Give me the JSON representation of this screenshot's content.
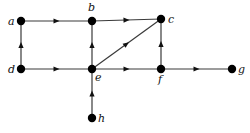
{
  "diagram": {
    "type": "directed-graph",
    "colors": {
      "edge": "#3a3a3a",
      "node": "#000000",
      "label": "#111111",
      "background": "#ffffff"
    },
    "nodes": [
      {
        "id": "a",
        "label": "a",
        "x": 21,
        "y": 21,
        "lx": 8,
        "ly": 25
      },
      {
        "id": "b",
        "label": "b",
        "x": 92,
        "y": 21,
        "lx": 88,
        "ly": 11
      },
      {
        "id": "c",
        "label": "c",
        "x": 161,
        "y": 19,
        "lx": 168,
        "ly": 23
      },
      {
        "id": "d",
        "label": "d",
        "x": 21,
        "y": 69,
        "lx": 8,
        "ly": 73
      },
      {
        "id": "e",
        "label": "e",
        "x": 92,
        "y": 69,
        "lx": 95,
        "ly": 81
      },
      {
        "id": "f",
        "label": "f",
        "x": 161,
        "y": 69,
        "lx": 158,
        "ly": 83
      },
      {
        "id": "g",
        "label": "g",
        "x": 232,
        "y": 69,
        "lx": 238,
        "ly": 73
      },
      {
        "id": "h",
        "label": "h",
        "x": 92,
        "y": 118,
        "lx": 98,
        "ly": 122
      }
    ],
    "edges": [
      {
        "from": "a",
        "to": "b"
      },
      {
        "from": "d",
        "to": "a"
      },
      {
        "from": "d",
        "to": "e"
      },
      {
        "from": "e",
        "to": "b"
      },
      {
        "from": "b",
        "to": "c"
      },
      {
        "from": "e",
        "to": "c"
      },
      {
        "from": "f",
        "to": "c"
      },
      {
        "from": "e",
        "to": "f"
      },
      {
        "from": "f",
        "to": "g"
      },
      {
        "from": "h",
        "to": "e"
      }
    ]
  }
}
